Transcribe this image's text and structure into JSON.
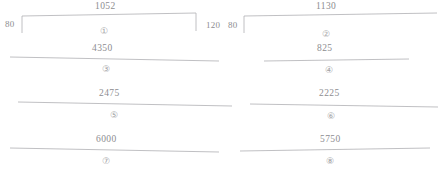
{
  "diagram": {
    "line_color": "#b0b0b4",
    "text_color": "#8d8d90",
    "background": "#ffffff",
    "side_labels": [
      {
        "name": "left-edge-80",
        "text": "80"
      },
      {
        "name": "middle-120",
        "text": "120"
      },
      {
        "name": "middle-80",
        "text": "80"
      }
    ],
    "spans": [
      {
        "index": "①",
        "value": "1052",
        "style": "bracket",
        "column": "left",
        "row": 1
      },
      {
        "index": "②",
        "value": "1130",
        "style": "bracket",
        "column": "right",
        "row": 1
      },
      {
        "index": "③",
        "value": "4350",
        "style": "line",
        "column": "left",
        "row": 2
      },
      {
        "index": "④",
        "value": "825",
        "style": "line",
        "column": "right",
        "row": 2
      },
      {
        "index": "⑤",
        "value": "2475",
        "style": "line",
        "column": "left",
        "row": 3
      },
      {
        "index": "⑥",
        "value": "2225",
        "style": "line",
        "column": "right",
        "row": 3
      },
      {
        "index": "⑦",
        "value": "6000",
        "style": "line",
        "column": "left",
        "row": 4
      },
      {
        "index": "⑧",
        "value": "5750",
        "style": "line",
        "column": "right",
        "row": 4
      }
    ]
  }
}
